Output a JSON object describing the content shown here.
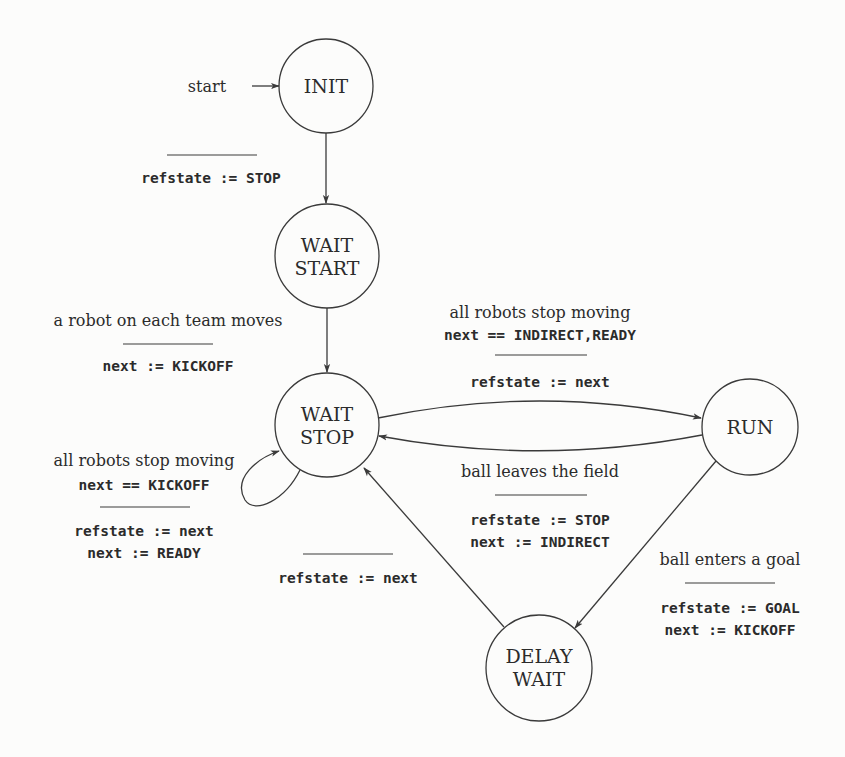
{
  "diagram": {
    "type": "state-machine",
    "colors": {
      "ink": "#2b2b2b",
      "stroke": "#3a3a3a",
      "paper": "#fcfcfb"
    },
    "start_label": "start",
    "states": {
      "init": {
        "lines": [
          "INIT"
        ]
      },
      "wait_start": {
        "lines": [
          "WAIT",
          "START"
        ]
      },
      "wait_stop": {
        "lines": [
          "WAIT",
          "STOP"
        ]
      },
      "run": {
        "lines": [
          "RUN"
        ]
      },
      "delay_wait": {
        "lines": [
          "DELAY",
          "WAIT"
        ]
      }
    },
    "transitions": {
      "init_to_wait_start": {
        "from": "INIT",
        "to": "WAIT START",
        "guard": [],
        "actions": [
          "refstate := STOP"
        ]
      },
      "wait_start_to_wait_stop": {
        "from": "WAIT START",
        "to": "WAIT STOP",
        "guard": [
          "a robot on each team moves"
        ],
        "actions": [
          "next := KICKOFF"
        ]
      },
      "wait_stop_self_loop": {
        "from": "WAIT STOP",
        "to": "WAIT STOP",
        "guard": [
          "all robots stop moving",
          "next == KICKOFF"
        ],
        "actions": [
          "refstate := next",
          "next := READY"
        ]
      },
      "wait_stop_to_run": {
        "from": "WAIT STOP",
        "to": "RUN",
        "guard": [
          "all robots stop moving",
          "next == INDIRECT,READY"
        ],
        "actions": [
          "refstate := next"
        ]
      },
      "run_to_wait_stop": {
        "from": "RUN",
        "to": "WAIT STOP",
        "guard": [
          "ball leaves the field"
        ],
        "actions": [
          "refstate := STOP",
          "next := INDIRECT"
        ]
      },
      "run_to_delay_wait": {
        "from": "RUN",
        "to": "DELAY WAIT",
        "guard": [
          "ball enters a goal"
        ],
        "actions": [
          "refstate := GOAL",
          "next := KICKOFF"
        ]
      },
      "delay_wait_to_wait_stop": {
        "from": "DELAY WAIT",
        "to": "WAIT STOP",
        "guard": [],
        "actions": [
          "refstate := next"
        ]
      }
    }
  }
}
